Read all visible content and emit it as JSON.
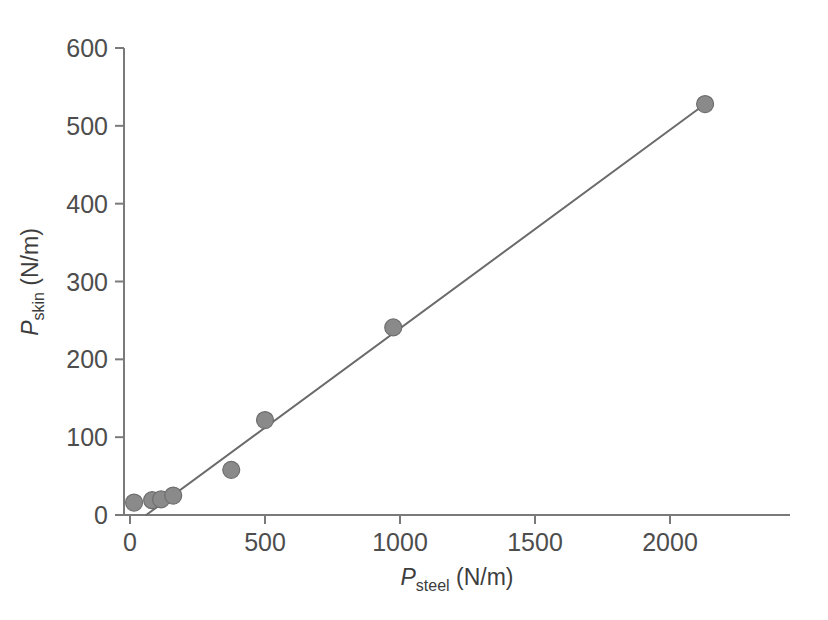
{
  "chart_data": {
    "type": "scatter",
    "title": "",
    "subtitle": "",
    "xlabel": "P_steel (N/m)",
    "ylabel": "P_skin (N/m)",
    "xlabel_parts": {
      "symbol": "P",
      "subscript": "steel",
      "units": "(N/m)"
    },
    "ylabel_parts": {
      "symbol": "P",
      "subscript": "skin",
      "units": "(N/m)"
    },
    "xlim": [
      0,
      2400
    ],
    "ylim": [
      0,
      600
    ],
    "xticks": [
      0,
      500,
      1000,
      1500,
      2000
    ],
    "yticks": [
      0,
      100,
      200,
      300,
      400,
      500,
      600
    ],
    "xtick_labels": [
      "0",
      "500",
      "1000",
      "1500",
      "2000"
    ],
    "ytick_labels": [
      "0",
      "100",
      "200",
      "300",
      "400",
      "500",
      "600"
    ],
    "grid": false,
    "legend": null,
    "marker": {
      "shape": "circle",
      "fill_color": "#8a8a8a",
      "edge_color": "#6e6e6e",
      "size_px": 17
    },
    "series": [
      {
        "name": "measurements",
        "points": [
          {
            "x": 15,
            "y": 16
          },
          {
            "x": 82,
            "y": 19
          },
          {
            "x": 115,
            "y": 20
          },
          {
            "x": 160,
            "y": 25
          },
          {
            "x": 375,
            "y": 58
          },
          {
            "x": 500,
            "y": 122
          },
          {
            "x": 975,
            "y": 241
          },
          {
            "x": 2130,
            "y": 528
          }
        ]
      }
    ],
    "fit_line": {
      "name": "linear-fit",
      "color": "#6b6b6b",
      "width_px": 2,
      "x_start": 60,
      "y_start": 0,
      "x_end": 2130,
      "y_end": 528,
      "slope": 0.255,
      "intercept": -15.3
    },
    "axis": {
      "color": "#7a7a7a",
      "width_px": 2,
      "tick_length_px": 9,
      "x_axis_extends_to": 2400
    }
  }
}
